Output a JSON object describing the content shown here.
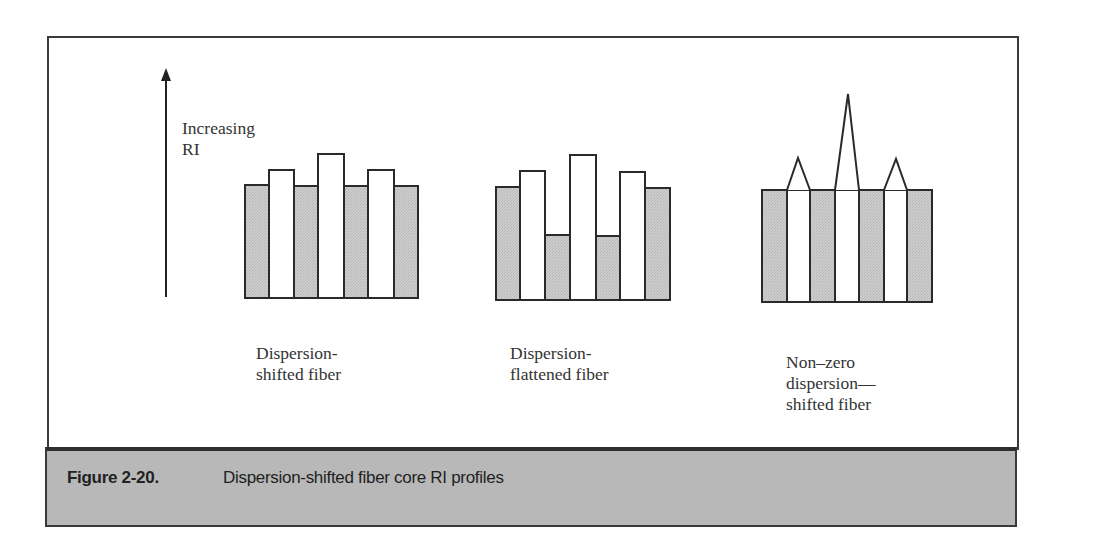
{
  "axis": {
    "label_line1": "Increasing",
    "label_line2": "RI",
    "arrow_icon": "up-arrow-icon"
  },
  "profiles": [
    {
      "id": "dispersion-shifted",
      "label_line1": "Dispersion-",
      "label_line2": "shifted fiber",
      "shape": "step",
      "bars": [
        {
          "type": "cladding",
          "top": 185
        },
        {
          "type": "core",
          "top": 170
        },
        {
          "type": "cladding",
          "top": 186
        },
        {
          "type": "core",
          "top": 154
        },
        {
          "type": "cladding",
          "top": 186
        },
        {
          "type": "core",
          "top": 170
        },
        {
          "type": "cladding",
          "top": 186
        }
      ]
    },
    {
      "id": "dispersion-flattened",
      "label_line1": "Dispersion-",
      "label_line2": "flattened fiber",
      "shape": "step",
      "bars": [
        {
          "type": "cladding",
          "top": 187
        },
        {
          "type": "core",
          "top": 171
        },
        {
          "type": "cladding",
          "top": 235
        },
        {
          "type": "core",
          "top": 155
        },
        {
          "type": "cladding",
          "top": 236
        },
        {
          "type": "core",
          "top": 172
        },
        {
          "type": "cladding",
          "top": 188
        }
      ]
    },
    {
      "id": "non-zero-dispersion-shifted",
      "label_line1": "Non–zero",
      "label_line2": "dispersion—",
      "label_line3": "shifted fiber",
      "shape": "graded-peaks",
      "peaks": [
        {
          "type": "core",
          "apex": 158
        },
        {
          "type": "core",
          "apex": 94
        },
        {
          "type": "core",
          "apex": 159
        }
      ]
    }
  ],
  "caption": {
    "label": "Figure 2-20.",
    "text": "Dispersion-shifted fiber core RI profiles"
  },
  "colors": {
    "cladding_fill": "#c8c8c8",
    "core_fill": "#ffffff",
    "stroke": "#2a2a2a",
    "caption_bg": "#b8b8b8"
  }
}
